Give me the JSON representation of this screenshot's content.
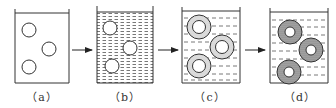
{
  "figure": {
    "panels": [
      {
        "id": "a",
        "label": "（a）",
        "liquid": "none",
        "particles": "plain-circles"
      },
      {
        "id": "b",
        "label": "（b）",
        "liquid": "dense-dashed",
        "particles": "plain-circles"
      },
      {
        "id": "c",
        "label": "（c）",
        "liquid": "sparse-dashed",
        "particles": "thin-dotted-rings"
      },
      {
        "id": "d",
        "label": "（d）",
        "liquid": "sparse-dashed",
        "particles": "thick-shaded-rings"
      }
    ],
    "arrows": [
      "a-to-b",
      "b-to-c",
      "c-to-d"
    ],
    "colors": {
      "stroke": "#333333",
      "background": "#ffffff",
      "ring_fill_light": "#d9d9d9",
      "ring_fill_dark": "#9a9a9a"
    }
  }
}
